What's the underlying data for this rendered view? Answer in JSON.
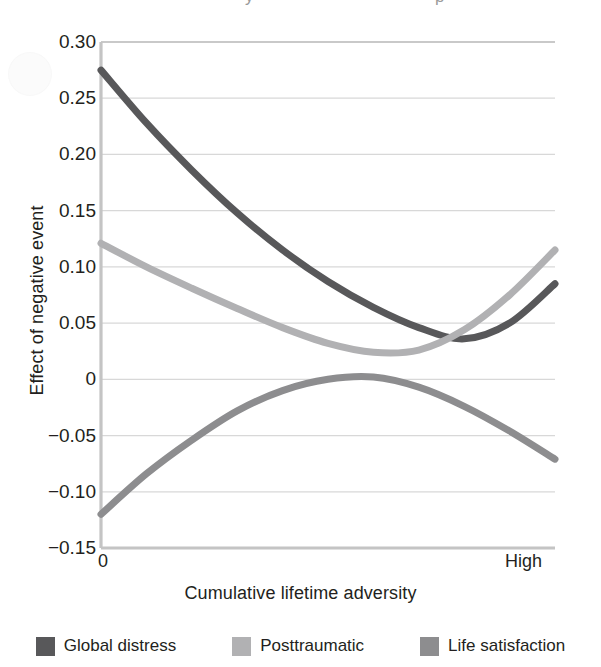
{
  "figure": {
    "scan_artifact_text": "y                           p",
    "watermark": "faint-circular-watermark"
  },
  "chart_data": {
    "type": "line",
    "title": "",
    "xlabel": "Cumulative lifetime adversity",
    "ylabel": "Effect of negative event",
    "ylim": [
      -0.15,
      0.3
    ],
    "xlim": [
      0,
      1
    ],
    "grid": true,
    "legend_position": "bottom",
    "ytick_labels": [
      "0.30",
      "0.25",
      "0.20",
      "0.15",
      "0.10",
      "0.05",
      "0",
      "−0.05",
      "−0.10",
      "−0.15"
    ],
    "ytick_values": [
      0.3,
      0.25,
      0.2,
      0.15,
      0.1,
      0.05,
      0,
      -0.05,
      -0.1,
      -0.15
    ],
    "xtick_labels": [
      "0",
      "High"
    ],
    "xtick_values": [
      0,
      1
    ],
    "series": [
      {
        "name": "Global distress",
        "color": "#58585a",
        "x": [
          0.0,
          0.1,
          0.2,
          0.3,
          0.4,
          0.5,
          0.6,
          0.7,
          0.8,
          0.9,
          1.0
        ],
        "values": [
          0.275,
          0.228,
          0.186,
          0.148,
          0.115,
          0.087,
          0.064,
          0.046,
          0.036,
          0.05,
          0.085
        ]
      },
      {
        "name": "Posttraumatic",
        "color": "#b1b1b3",
        "x": [
          0.0,
          0.1,
          0.2,
          0.3,
          0.4,
          0.5,
          0.6,
          0.7,
          0.8,
          0.9,
          1.0
        ],
        "values": [
          0.121,
          0.1,
          0.081,
          0.063,
          0.046,
          0.032,
          0.024,
          0.026,
          0.044,
          0.075,
          0.115
        ]
      },
      {
        "name": "Life satisfaction",
        "color": "#8d8d8f",
        "x": [
          0.0,
          0.1,
          0.2,
          0.3,
          0.4,
          0.5,
          0.6,
          0.7,
          0.8,
          0.9,
          1.0
        ],
        "values": [
          -0.12,
          -0.084,
          -0.054,
          -0.028,
          -0.01,
          0.0,
          0.002,
          -0.007,
          -0.024,
          -0.046,
          -0.071
        ]
      }
    ]
  }
}
